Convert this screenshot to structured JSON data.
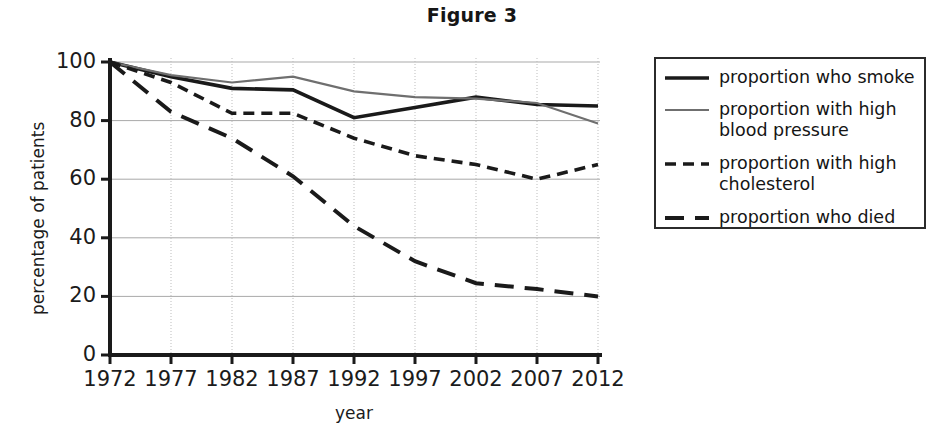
{
  "title": "Figure 3",
  "axes": {
    "xlabel": "year",
    "ylabel": "percentage of patients",
    "ytick_labels": [
      "100",
      "80",
      "60",
      "40",
      "20",
      "0"
    ],
    "xtick_labels": [
      "1972",
      "1977",
      "1982",
      "1987",
      "1992",
      "1997",
      "2002",
      "2007",
      "2012"
    ]
  },
  "legend": {
    "items": [
      {
        "label": "proportion who smoke",
        "style": "solid-thick-black",
        "color": "#1a1a1a"
      },
      {
        "label": "proportion with high\nblood pressure",
        "style": "solid-thin-gray",
        "color": "#6f6f6f"
      },
      {
        "label": "proportion with high\ncholesterol",
        "style": "short-dash-black",
        "color": "#1a1a1a"
      },
      {
        "label": "proportion who died",
        "style": "long-dash-black",
        "color": "#1a1a1a"
      }
    ]
  },
  "chart_data": {
    "type": "line",
    "title": "Figure 3",
    "xlabel": "year",
    "ylabel": "percentage of patients",
    "x": [
      1972,
      1977,
      1982,
      1987,
      1992,
      1997,
      2002,
      2007,
      2012
    ],
    "categories": [
      "1972",
      "1977",
      "1982",
      "1987",
      "1992",
      "1997",
      "2002",
      "2007",
      "2012"
    ],
    "xlim": [
      1972,
      2012
    ],
    "ylim": [
      0,
      100
    ],
    "yticks": [
      0,
      20,
      40,
      60,
      80,
      100
    ],
    "grid": true,
    "legend_position": "right",
    "series": [
      {
        "name": "proportion who smoke",
        "style": "solid-thick-black",
        "color": "#1a1a1a",
        "values": [
          100,
          95,
          91,
          90.5,
          81,
          84.5,
          88,
          85.5,
          85
        ]
      },
      {
        "name": "proportion with high blood pressure",
        "style": "solid-thin-gray",
        "color": "#6f6f6f",
        "values": [
          100,
          95.5,
          93,
          95,
          90,
          88,
          87.5,
          86,
          79
        ]
      },
      {
        "name": "proportion with high cholesterol",
        "style": "short-dash-black",
        "color": "#1a1a1a",
        "values": [
          100,
          93,
          82.5,
          82.5,
          74,
          68,
          65,
          60,
          65
        ]
      },
      {
        "name": "proportion who died",
        "style": "long-dash-black",
        "color": "#1a1a1a",
        "values": [
          100,
          83,
          74,
          61,
          44,
          32,
          24.5,
          22.5,
          20
        ]
      }
    ]
  }
}
